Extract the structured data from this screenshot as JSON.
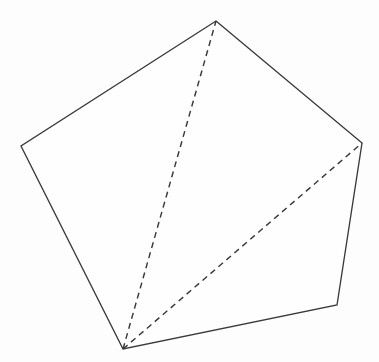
{
  "figure": {
    "canvas": {
      "width": 379,
      "height": 362,
      "background_color": "#fdfdfd"
    },
    "stroke_color": "#3a3a3a",
    "fill_color": "#fefefe",
    "solid_stroke_width": 1.35,
    "dashed_stroke_width": 1.45,
    "dash_pattern": "6,4.5"
  },
  "chart_data": {
    "type": "diagram",
    "shape": "pentagon",
    "vertices": [
      {
        "name": "top",
        "label": "A",
        "x": 216,
        "y": 21
      },
      {
        "name": "right",
        "label": "B",
        "x": 362,
        "y": 143
      },
      {
        "name": "bottom-right",
        "label": "C",
        "x": 337,
        "y": 305
      },
      {
        "name": "bottom-left",
        "label": "D",
        "x": 123,
        "y": 349
      },
      {
        "name": "left",
        "label": "E",
        "x": 21,
        "y": 146
      }
    ],
    "edges": [
      {
        "from": "top",
        "to": "right",
        "style": "solid"
      },
      {
        "from": "right",
        "to": "bottom-right",
        "style": "solid"
      },
      {
        "from": "bottom-right",
        "to": "bottom-left",
        "style": "solid"
      },
      {
        "from": "bottom-left",
        "to": "left",
        "style": "solid"
      },
      {
        "from": "left",
        "to": "top",
        "style": "solid"
      }
    ],
    "diagonals": [
      {
        "from": "bottom-left",
        "to": "top",
        "style": "dashed"
      },
      {
        "from": "bottom-left",
        "to": "right",
        "style": "dashed"
      }
    ],
    "polygon_points": "216,21 362,143 337,305 123,349 21,146",
    "diagonal_1_points": "123,349 216,21",
    "diagonal_2_points": "123,349 362,143",
    "xlabel": "",
    "ylabel": "",
    "grid": false,
    "legend": false,
    "annotations": []
  }
}
